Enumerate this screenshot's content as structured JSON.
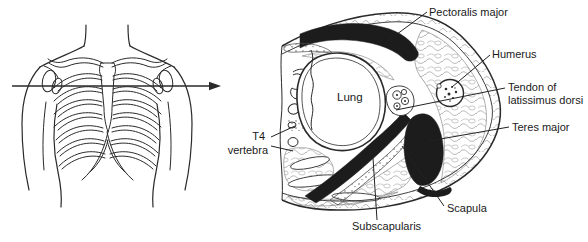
{
  "labels": {
    "pectoralis_major": "Pectoralis major",
    "humerus": "Humerus",
    "tendon_of_latissimus_dorsi": {
      "line1": "Tendon of",
      "line2": "latissimus dorsi"
    },
    "teres_major": "Teres major",
    "lung": "Lung",
    "t4_vertebra": {
      "line1": "T4",
      "line2": "vertebra"
    },
    "scapula": "Scapula",
    "subscapularis": "Subscapularis"
  },
  "colors": {
    "ink": "#2a2a2a",
    "muscle_fill": "#1c1c1c",
    "texture_gray": "#9b9b9b",
    "background": "#ffffff"
  }
}
